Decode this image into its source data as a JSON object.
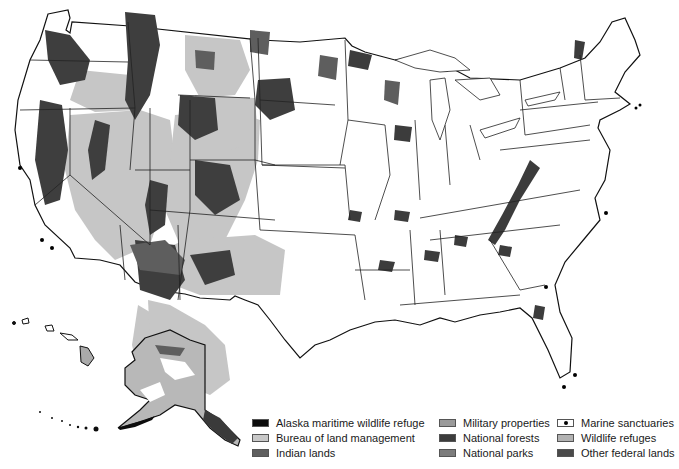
{
  "map": {
    "title": "Federal lands of the United States",
    "regions_shown": [
      "Contiguous United States",
      "Alaska",
      "Hawaii"
    ]
  },
  "legend": {
    "columns": [
      [
        {
          "label": "Alaska maritime wildlife refuge",
          "color": "#0c0c0c",
          "icon": "solid-swatch"
        },
        {
          "label": "Bureau of land management",
          "color": "#c8c8c8",
          "icon": "solid-swatch"
        },
        {
          "label": "Indian lands",
          "color": "#5f5f5f",
          "icon": "solid-swatch"
        }
      ],
      [
        {
          "label": "Military properties",
          "color": "#9a9a9a",
          "icon": "solid-swatch"
        },
        {
          "label": "National forests",
          "color": "#3c3c3c",
          "icon": "solid-swatch"
        },
        {
          "label": "National parks",
          "color": "#7c7c7c",
          "icon": "solid-swatch"
        }
      ],
      [
        {
          "label": "Marine sanctuaries",
          "color": "#ffffff",
          "icon": "dot-swatch"
        },
        {
          "label": "Wildlife refuges",
          "color": "#b2b2b2",
          "icon": "solid-swatch"
        },
        {
          "label": "Other federal lands",
          "color": "#4a4a4a",
          "icon": "solid-swatch"
        }
      ]
    ]
  },
  "colors": {
    "background": "#ffffff",
    "border": "#111111",
    "blm": "#c8c8c8",
    "forest": "#3c3c3c",
    "indian": "#5f5f5f",
    "park": "#7c7c7c"
  }
}
